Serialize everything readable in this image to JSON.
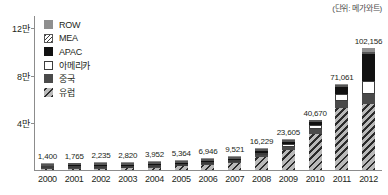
{
  "unit_caption": "(단위: 메가와트)",
  "legend": {
    "items": [
      {
        "key": "row",
        "label": "ROW",
        "fill": "fill-row",
        "color": "#8f8f8f"
      },
      {
        "key": "mea",
        "label": "MEA",
        "fill": "fill-mea",
        "color": "#ffffff"
      },
      {
        "key": "apac",
        "label": "APAC",
        "fill": "fill-apac",
        "color": "#111111"
      },
      {
        "key": "americas",
        "label": "아메리카",
        "fill": "fill-americas",
        "color": "#ffffff"
      },
      {
        "key": "china",
        "label": "중국",
        "fill": "fill-china",
        "color": "#4a4a4a"
      },
      {
        "key": "europe",
        "label": "유럽",
        "fill": "fill-europe",
        "color": "#6e6e6e"
      }
    ]
  },
  "axis": {
    "y_ticks": [
      {
        "label": "12만",
        "value": 120000
      },
      {
        "label": "8만",
        "value": 80000
      },
      {
        "label": "4만",
        "value": 40000
      },
      {
        "label": "",
        "value": 0
      }
    ],
    "y_max": 130000
  },
  "chart_data": {
    "type": "bar",
    "stacked": true,
    "title": "",
    "subtitle": "",
    "xlabel": "",
    "ylabel": "",
    "unit": "메가와트",
    "ylim": [
      0,
      130000
    ],
    "grid": false,
    "legend_position": "top-left",
    "categories": [
      "2000",
      "2001",
      "2002",
      "2003",
      "2004",
      "2005",
      "2006",
      "2007",
      "2008",
      "2009",
      "2010",
      "2011",
      "2012"
    ],
    "totals": [
      1400,
      1765,
      2235,
      2820,
      3952,
      5364,
      6946,
      9521,
      16229,
      23605,
      40670,
      71061,
      102156
    ],
    "total_labels": [
      "1,400",
      "1,765",
      "2,235",
      "2,820",
      "3,952",
      "5,364",
      "6,946",
      "9,521",
      "16,229",
      "23,605",
      "40,670",
      "71,061",
      "102,156"
    ],
    "series": [
      {
        "name": "유럽",
        "key": "europe",
        "values": [
          600,
          800,
          1050,
          1400,
          2100,
          3100,
          4300,
          6000,
          11000,
          17000,
          30200,
          52300,
          55500
        ]
      },
      {
        "name": "중국",
        "key": "china",
        "values": [
          150,
          190,
          240,
          300,
          400,
          520,
          680,
          900,
          1500,
          2400,
          3800,
          5500,
          8300
        ]
      },
      {
        "name": "아메리카",
        "key": "americas",
        "values": [
          330,
          400,
          480,
          580,
          740,
          950,
          1100,
          1400,
          2100,
          2500,
          3400,
          5800,
          11200
        ]
      },
      {
        "name": "APAC",
        "key": "apac",
        "values": [
          260,
          300,
          350,
          400,
          530,
          650,
          700,
          950,
          1300,
          1400,
          2600,
          5800,
          22200
        ]
      },
      {
        "name": "MEA",
        "key": "mea",
        "values": [
          30,
          40,
          55,
          70,
          90,
          65,
          80,
          130,
          170,
          155,
          320,
          660,
          2200
        ]
      },
      {
        "name": "ROW",
        "key": "row",
        "values": [
          30,
          35,
          60,
          70,
          92,
          79,
          86,
          141,
          159,
          150,
          350,
          1001,
          2756
        ]
      }
    ]
  }
}
